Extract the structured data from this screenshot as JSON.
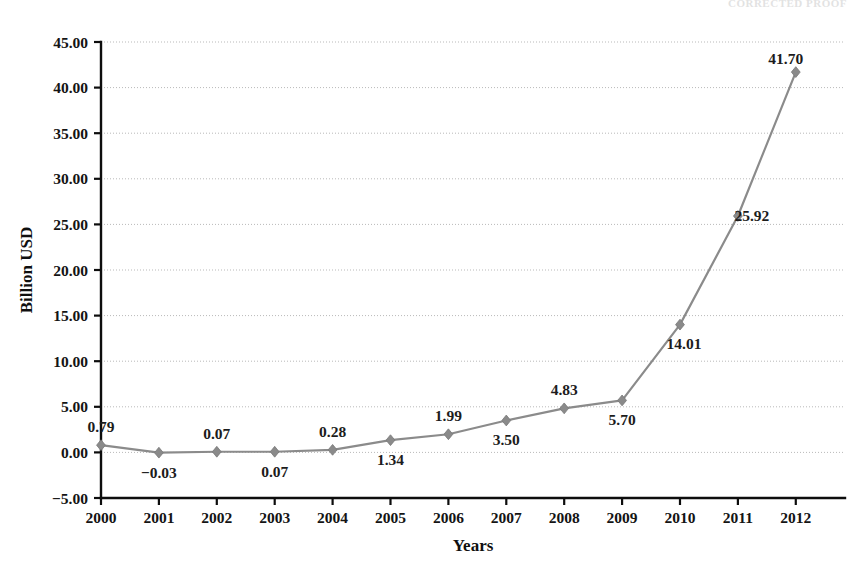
{
  "figure": {
    "clipped_header_text": "CORRECTED  PROOF",
    "background_color": "#ffffff"
  },
  "chart_data": {
    "type": "line",
    "title": "",
    "xlabel": "Years",
    "ylabel": "Billion USD",
    "categories": [
      "2000",
      "2001",
      "2002",
      "2003",
      "2004",
      "2005",
      "2006",
      "2007",
      "2008",
      "2009",
      "2010",
      "2011",
      "2012"
    ],
    "values": [
      0.79,
      -0.03,
      0.07,
      0.07,
      0.28,
      1.34,
      1.99,
      3.5,
      4.83,
      5.7,
      14.01,
      25.92,
      41.7
    ],
    "point_labels": [
      "0.79",
      "-0.03",
      "0.07",
      "0.07",
      "0.28",
      "1.34",
      "1.99",
      "3.50",
      "4.83",
      "5.70",
      "14.01",
      "25.92",
      "41.70"
    ],
    "label_positions": [
      "above",
      "below",
      "above",
      "below",
      "above",
      "below",
      "above",
      "below",
      "above",
      "below",
      "below-right",
      "right",
      "above-left"
    ],
    "ylim": [
      -5.0,
      45.0
    ],
    "ytick_values": [
      -5.0,
      0.0,
      5.0,
      10.0,
      15.0,
      20.0,
      25.0,
      30.0,
      35.0,
      40.0,
      45.0
    ],
    "ytick_labels": [
      "-5.00",
      "0.00",
      "5.00",
      "10.00",
      "15.00",
      "20.00",
      "25.00",
      "30.00",
      "35.00",
      "40.00",
      "45.00"
    ],
    "grid": true,
    "grid_axis": "y",
    "legend": false,
    "legend_position": "none",
    "series_color": "#8b8b8b",
    "marker_shape": "diamond",
    "marker_color": "#8a8a8a",
    "gridline_color": "#b9b9b9",
    "axis_color": "#0d0d0d"
  }
}
